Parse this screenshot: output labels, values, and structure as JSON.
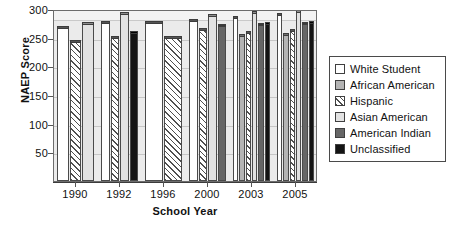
{
  "chart_data": {
    "type": "bar",
    "title": "",
    "xlabel": "School Year",
    "ylabel": "NAEP Score",
    "categories": [
      "1990",
      "1992",
      "1996",
      "2000",
      "2003",
      "2005"
    ],
    "ylim": [
      0,
      300
    ],
    "yticks": [
      50,
      100,
      150,
      200,
      250,
      300
    ],
    "grid": true,
    "legend_position": "right",
    "series": [
      {
        "name": "White Student",
        "color": "#ffffff",
        "pattern": "solid",
        "values": [
          267,
          275,
          276,
          279,
          285,
          289
        ]
      },
      {
        "name": "African American",
        "color": "#b4b4b4",
        "pattern": "solid",
        "values": [
          null,
          null,
          null,
          null,
          253,
          255
        ]
      },
      {
        "name": "Hispanic",
        "color": "#ffffff",
        "pattern": "diagonal-hatch",
        "values": [
          243,
          250,
          250,
          264,
          258,
          262
        ]
      },
      {
        "name": "Asian American",
        "color": "#e2e2e2",
        "pattern": "solid",
        "values": [
          274,
          291,
          null,
          288,
          293,
          295
        ]
      },
      {
        "name": "American Indian",
        "color": "#666666",
        "pattern": "solid",
        "values": [
          null,
          null,
          null,
          270,
          272,
          274
        ]
      },
      {
        "name": "Unclassified",
        "color": "#141414",
        "pattern": "solid",
        "values": [
          null,
          258,
          null,
          null,
          273,
          275
        ]
      }
    ]
  },
  "axes": {
    "ylabel": "NAEP Score",
    "xlabel": "School Year",
    "ytick_labels": [
      "50",
      "100",
      "150",
      "200",
      "250",
      "300"
    ],
    "xtick_labels": [
      "1990",
      "1992",
      "1996",
      "2000",
      "2003",
      "2005"
    ]
  },
  "legend": {
    "items": [
      {
        "label": "White Student",
        "swatch": "white-swatch"
      },
      {
        "label": "African American",
        "swatch": "gray-swatch"
      },
      {
        "label": "Hispanic",
        "swatch": "hatch-swatch"
      },
      {
        "label": "Asian American",
        "swatch": "light-gray-swatch"
      },
      {
        "label": "American Indian",
        "swatch": "dark-gray-swatch"
      },
      {
        "label": "Unclassified",
        "swatch": "black-swatch"
      }
    ]
  },
  "colors": {
    "plot_background": "#ebebeb",
    "frame": "#6d6d6d",
    "gridline": "#c6c6c6"
  }
}
